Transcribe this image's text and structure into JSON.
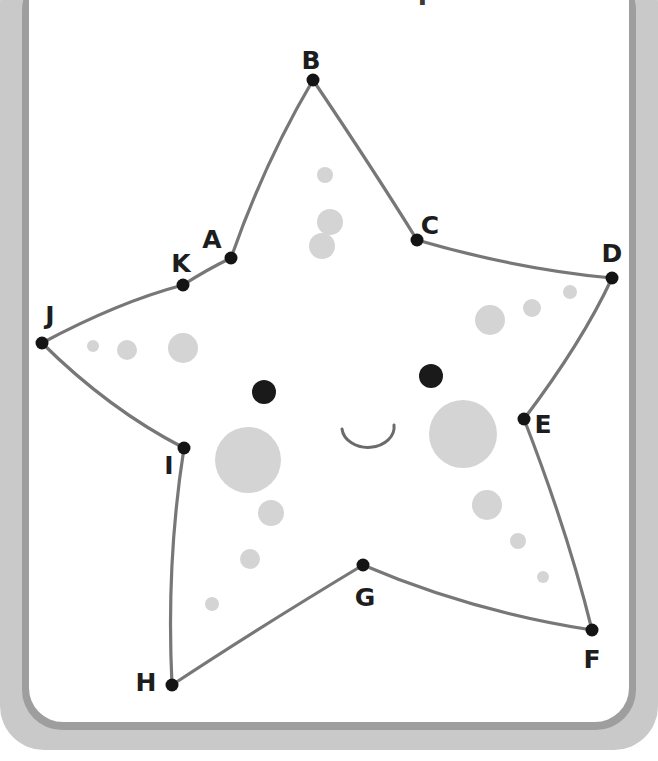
{
  "document": {
    "title": "Connect the dots puzzle",
    "card_background": "#ffffff",
    "frame_color": "#c9c9c9",
    "frame_shadow_color": "#9e9e9e"
  },
  "figure": {
    "name": "starfish-connect-the-dots",
    "stroke_color": "#6b6b6b",
    "dot_color": "#141414",
    "spot_color": "#d4d4d4",
    "eye_color": "#1a1a1a",
    "mouth_color": "#6b6b6b",
    "points": [
      {
        "id": "A",
        "label": "A",
        "x": 231,
        "y": 258,
        "label_x": 212,
        "label_y": 239
      },
      {
        "id": "B",
        "label": "B",
        "x": 313,
        "y": 80,
        "label_x": 311,
        "label_y": 60
      },
      {
        "id": "C",
        "label": "C",
        "x": 417,
        "y": 240,
        "label_x": 430,
        "label_y": 225
      },
      {
        "id": "D",
        "label": "D",
        "x": 612,
        "y": 278,
        "label_x": 612,
        "label_y": 253
      },
      {
        "id": "E",
        "label": "E",
        "x": 524,
        "y": 419,
        "label_x": 543,
        "label_y": 424
      },
      {
        "id": "F",
        "label": "F",
        "x": 592,
        "y": 630,
        "label_x": 592,
        "label_y": 659
      },
      {
        "id": "G",
        "label": "G",
        "x": 363,
        "y": 565,
        "label_x": 365,
        "label_y": 597
      },
      {
        "id": "H",
        "label": "H",
        "x": 172,
        "y": 685,
        "label_x": 146,
        "label_y": 682
      },
      {
        "id": "I",
        "label": "I",
        "x": 184,
        "y": 448,
        "label_x": 169,
        "label_y": 465
      },
      {
        "id": "J",
        "label": "J",
        "x": 42,
        "y": 343,
        "label_x": 50,
        "label_y": 315
      },
      {
        "id": "K",
        "label": "K",
        "x": 183,
        "y": 285,
        "label_x": 181,
        "label_y": 263
      }
    ],
    "eyes": [
      {
        "cx": 264,
        "cy": 392,
        "r": 12
      },
      {
        "cx": 431,
        "cy": 376,
        "r": 12
      }
    ],
    "mouth": {
      "cx": 368,
      "cy": 435,
      "r": 26
    },
    "spots": [
      {
        "cx": 248,
        "cy": 460,
        "r": 33
      },
      {
        "cx": 463,
        "cy": 434,
        "r": 34
      },
      {
        "cx": 490,
        "cy": 320,
        "r": 15
      },
      {
        "cx": 532,
        "cy": 308,
        "r": 9
      },
      {
        "cx": 570,
        "cy": 292,
        "r": 7
      },
      {
        "cx": 487,
        "cy": 505,
        "r": 15
      },
      {
        "cx": 518,
        "cy": 541,
        "r": 8
      },
      {
        "cx": 543,
        "cy": 577,
        "r": 6
      },
      {
        "cx": 271,
        "cy": 513,
        "r": 13
      },
      {
        "cx": 250,
        "cy": 559,
        "r": 10
      },
      {
        "cx": 212,
        "cy": 604,
        "r": 7
      },
      {
        "cx": 325,
        "cy": 175,
        "r": 8
      },
      {
        "cx": 330,
        "cy": 222,
        "r": 13
      },
      {
        "cx": 322,
        "cy": 246,
        "r": 13
      },
      {
        "cx": 93,
        "cy": 346,
        "r": 6
      },
      {
        "cx": 127,
        "cy": 350,
        "r": 10
      },
      {
        "cx": 183,
        "cy": 348,
        "r": 15
      }
    ]
  }
}
